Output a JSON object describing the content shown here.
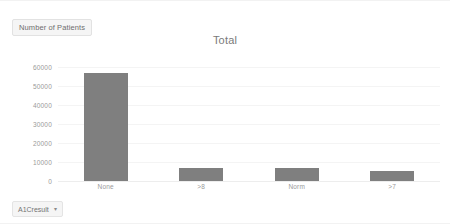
{
  "legend": {
    "badge_label": "Number of Patients"
  },
  "chart_title": "Total",
  "axis_field_button": {
    "label": "A1Cresult",
    "caret": "▾"
  },
  "chart_data": {
    "type": "bar",
    "title": "Total",
    "xlabel": "",
    "ylabel": "Number of Patients",
    "categories": [
      "None",
      ">8",
      "Norm",
      ">7"
    ],
    "values": [
      57000,
      7000,
      7000,
      5500
    ],
    "series": [
      {
        "name": "Number of Patients",
        "values": [
          57000,
          7000,
          7000,
          5500
        ]
      }
    ],
    "ylim": [
      0,
      60000
    ],
    "yticks": [
      0,
      10000,
      20000,
      30000,
      40000,
      50000,
      60000
    ],
    "ytick_labels": [
      "0",
      "10000",
      "20000",
      "30000",
      "40000",
      "50000",
      "60000"
    ],
    "grid": true,
    "legend_position": "top-left",
    "bar_color": "#7f7f7f",
    "background_color": "#ffffff",
    "gridline_color": "#f4f4f4"
  }
}
